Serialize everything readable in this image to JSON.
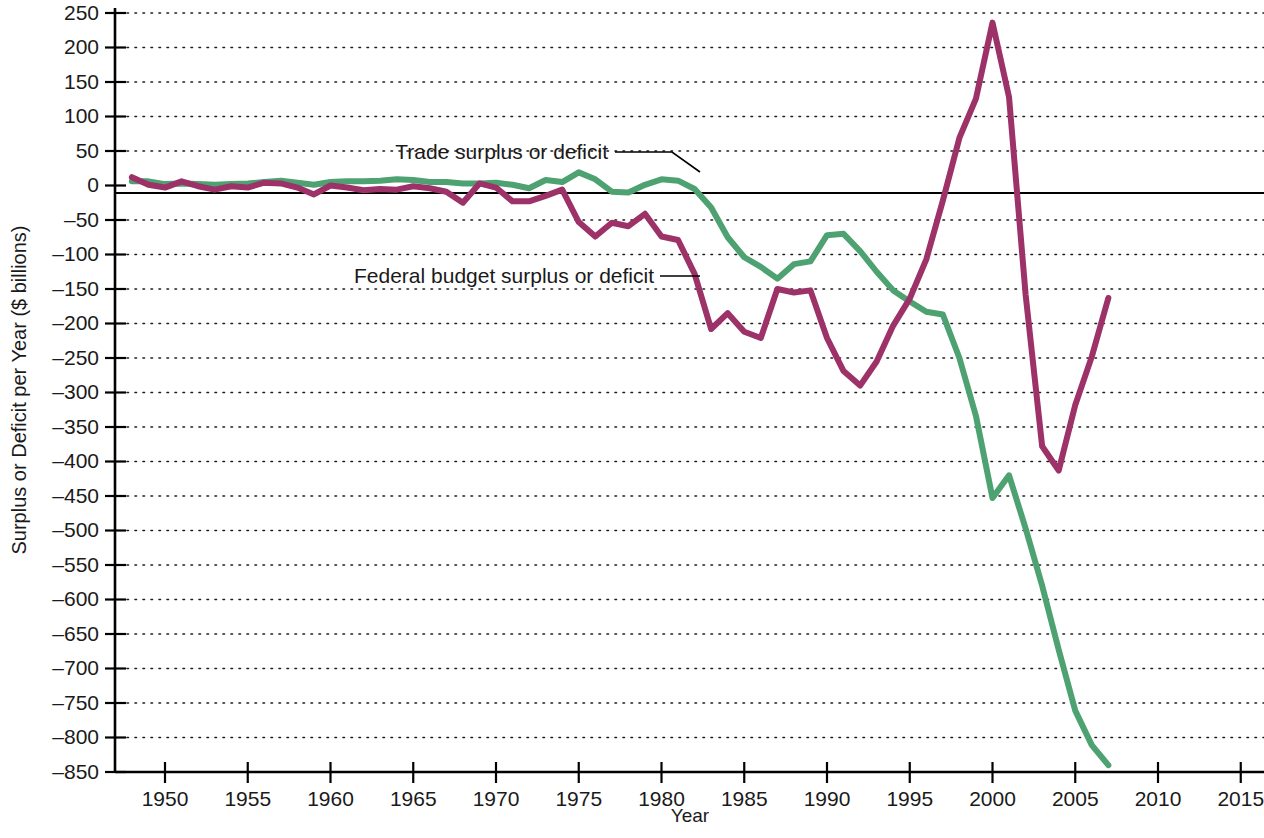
{
  "chart_data": {
    "type": "line",
    "title": "",
    "xlabel": "Year",
    "ylabel": "Surplus or Deficit per Year ($ billions)",
    "xlim": [
      1948,
      2016
    ],
    "ylim": [
      -850,
      250
    ],
    "grid": true,
    "legend_position": "inline-annotations",
    "y_ticks": [
      250,
      200,
      150,
      100,
      50,
      0,
      -50,
      -100,
      -150,
      -200,
      -250,
      -300,
      -350,
      -400,
      -450,
      -500,
      -550,
      -600,
      -650,
      -700,
      -750,
      -800,
      -850
    ],
    "y_tick_labels": [
      "250",
      "200",
      "150",
      "100",
      "50",
      "0",
      "–50",
      "–100",
      "–150",
      "–200",
      "–250",
      "–300",
      "–350",
      "–400",
      "–450",
      "–500",
      "–550",
      "–600",
      "–650",
      "–700",
      "–750",
      "–800",
      "–850"
    ],
    "x_ticks": [
      1950,
      1955,
      1960,
      1965,
      1970,
      1975,
      1980,
      1985,
      1990,
      1995,
      2000,
      2005,
      2010,
      2015
    ],
    "x_tick_labels": [
      "1950",
      "1955",
      "1960",
      "1965",
      "1970",
      "1975",
      "1980",
      "1985",
      "1990",
      "1995",
      "2000",
      "2005",
      "2010",
      "2015"
    ],
    "series": [
      {
        "name": "Trade surplus or deficit",
        "color": "#4EA271",
        "x": [
          1948,
          1949,
          1950,
          1951,
          1952,
          1953,
          1954,
          1955,
          1956,
          1957,
          1958,
          1959,
          1960,
          1961,
          1962,
          1963,
          1964,
          1965,
          1966,
          1967,
          1968,
          1969,
          1970,
          1971,
          1972,
          1973,
          1974,
          1975,
          1976,
          1977,
          1978,
          1979,
          1980,
          1981,
          1982,
          1983,
          1984,
          1985,
          1986,
          1987,
          1988,
          1989,
          1990,
          1991,
          1992,
          1993,
          1994,
          1995,
          1996,
          1997,
          1998,
          1999,
          2000,
          2001,
          2002,
          2003,
          2004,
          2005,
          2006,
          2007
        ],
        "values": [
          6,
          6,
          2,
          3,
          2,
          1,
          2,
          3,
          5,
          7,
          4,
          1,
          5,
          6,
          6,
          7,
          9,
          8,
          5,
          5,
          3,
          3,
          4,
          1,
          -4,
          8,
          5,
          19,
          9,
          -9,
          -10,
          1,
          9,
          7,
          -5,
          -32,
          -75,
          -104,
          -118,
          -135,
          -114,
          -110,
          -72,
          -70,
          -95,
          -125,
          -152,
          -168,
          -183,
          -187,
          -250,
          -334,
          -453,
          -420,
          -497,
          -580,
          -673,
          -761,
          -811,
          -840
        ]
      },
      {
        "name": "Federal budget surplus or deficit",
        "color": "#9C3268",
        "x": [
          1948,
          1949,
          1950,
          1951,
          1952,
          1953,
          1954,
          1955,
          1956,
          1957,
          1958,
          1959,
          1960,
          1961,
          1962,
          1963,
          1964,
          1965,
          1966,
          1967,
          1968,
          1969,
          1970,
          1971,
          1972,
          1973,
          1974,
          1975,
          1976,
          1977,
          1978,
          1979,
          1980,
          1981,
          1982,
          1983,
          1984,
          1985,
          1986,
          1987,
          1988,
          1989,
          1990,
          1991,
          1992,
          1993,
          1994,
          1995,
          1996,
          1997,
          1998,
          1999,
          2000,
          2001,
          2002,
          2003,
          2004,
          2005,
          2006,
          2007
        ],
        "values": [
          12,
          1,
          -3,
          6,
          -1,
          -6,
          -1,
          -3,
          4,
          3,
          -3,
          -13,
          0,
          -3,
          -7,
          -5,
          -6,
          -1,
          -4,
          -9,
          -25,
          3,
          -3,
          -23,
          -23,
          -15,
          -6,
          -53,
          -74,
          -54,
          -59,
          -41,
          -74,
          -79,
          -128,
          -208,
          -185,
          -212,
          -221,
          -150,
          -155,
          -152,
          -221,
          -269,
          -290,
          -255,
          -203,
          -164,
          -107,
          -22,
          69,
          126,
          236,
          128,
          -158,
          -378,
          -413,
          -318,
          -248,
          -163
        ]
      }
    ],
    "annotations": [
      {
        "text": "Trade surplus or deficit",
        "target_series": "Trade surplus or deficit"
      },
      {
        "text": "Federal budget surplus or deficit",
        "target_series": "Federal budget surplus or deficit"
      }
    ]
  }
}
